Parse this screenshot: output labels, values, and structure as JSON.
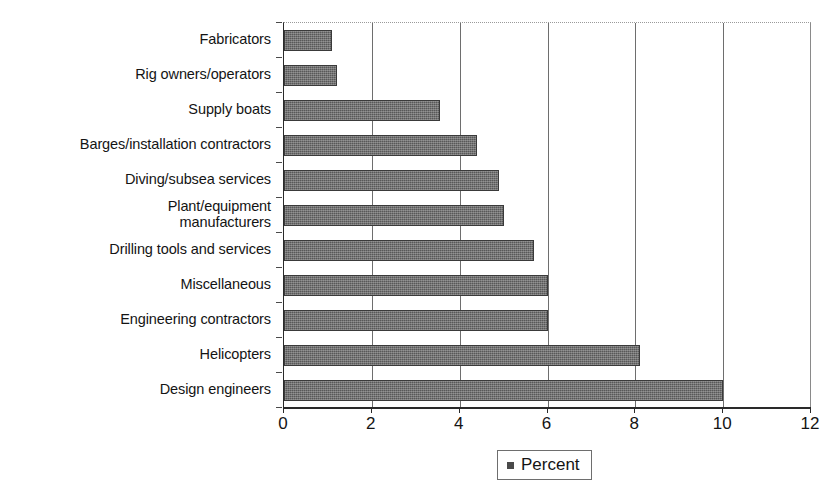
{
  "chart_data": {
    "type": "bar",
    "orientation": "horizontal",
    "title": "",
    "subtitle": "",
    "xlabel": "",
    "ylabel": "",
    "xlim": [
      0,
      12
    ],
    "xticks": [
      0,
      2,
      4,
      6,
      8,
      10,
      12
    ],
    "xtick_labels": [
      "0",
      "2",
      "4",
      "6",
      "8",
      "10",
      "12"
    ],
    "grid": "vertical",
    "legend_position": "bottom",
    "legend": [
      "Percent"
    ],
    "series_name": "Percent",
    "bar_color": "#585858",
    "bar_border_color": "#3a3a3a",
    "categories": [
      "Fabricators",
      "Rig owners/operators",
      "Supply boats",
      "Barges/installation contractors",
      "Diving/subsea services",
      "Plant/equipment\nmanufacturers",
      "Drilling tools and services",
      "Miscellaneous",
      "Engineering contractors",
      "Helicopters",
      "Design engineers"
    ],
    "values": [
      1.1,
      1.2,
      3.55,
      4.4,
      4.9,
      5.0,
      5.7,
      6.0,
      6.0,
      8.1,
      10.0
    ],
    "series": [
      {
        "name": "Percent",
        "values": [
          1.1,
          1.2,
          3.55,
          4.4,
          4.9,
          5.0,
          5.7,
          6.0,
          6.0,
          8.1,
          10.0
        ]
      }
    ]
  },
  "legend": {
    "label": "Percent",
    "marker": "square-marker"
  }
}
